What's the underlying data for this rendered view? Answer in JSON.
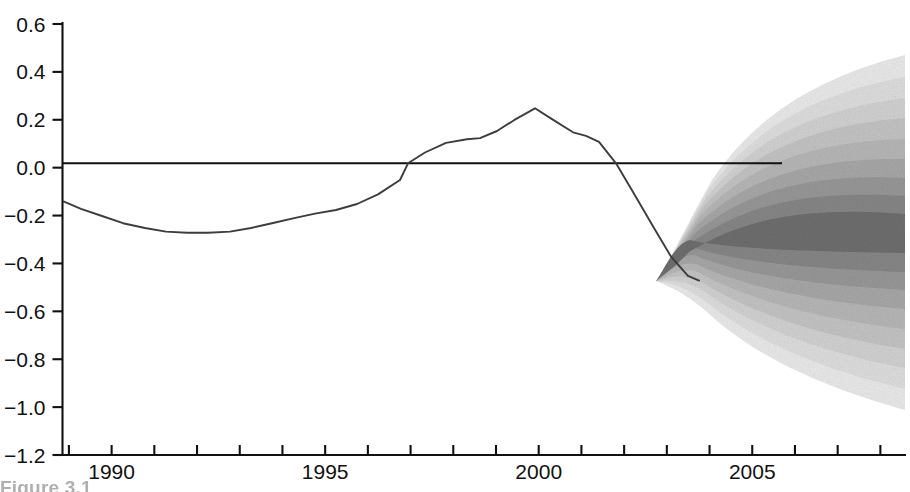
{
  "figure": {
    "caption_fragment": "Figure 3.1",
    "background_color": "#ffffff",
    "line_color": "#3a3a3a",
    "axis_color": "#111111",
    "fan_color": "#4a4a4a"
  },
  "axes": {
    "y": {
      "labels": [
        "0.6",
        "0.4",
        "0.2",
        "0.0",
        "−0.2",
        "−0.4",
        "−0.6",
        "−0.8",
        "−1.0",
        "−1.2"
      ],
      "values": [
        0.6,
        0.4,
        0.2,
        0.0,
        -0.2,
        -0.4,
        -0.6,
        -0.8,
        -1.0,
        -1.2
      ],
      "min": -1.2,
      "max": 0.6,
      "tick_step": 0.2
    },
    "x": {
      "labels": [
        "1990",
        "1995",
        "2000",
        "2005"
      ],
      "label_values": [
        1990,
        1995,
        2000,
        2005
      ],
      "ticks": [
        1989,
        1990,
        1991,
        1992,
        1993,
        1994,
        1995,
        1996,
        1997,
        1998,
        1999,
        2000,
        2001,
        2002,
        2003,
        2004,
        2005,
        2006,
        2007,
        2008
      ],
      "min": 1988.85,
      "max": 2008.6,
      "tick_step": 1
    }
  },
  "chart_data": {
    "type": "area",
    "title": "",
    "xlabel": "",
    "ylabel": "",
    "xlim": [
      1988.85,
      2008.6
    ],
    "ylim": [
      -1.2,
      0.6
    ],
    "grid": false,
    "legend": "none",
    "zero_line": {
      "value": 0.0,
      "x_start": 1988.85,
      "x_end": 2005.6
    },
    "series": [
      {
        "name": "History",
        "type": "line",
        "x": [
          1988.9,
          1989.3,
          1989.8,
          1990.3,
          1990.8,
          1991.3,
          1991.8,
          1992.3,
          1992.8,
          1993.3,
          1993.8,
          1994.3,
          1994.8,
          1995.3,
          1995.8,
          1996.3,
          1996.8,
          1997.0,
          1997.4,
          1997.9,
          1998.4,
          1998.7,
          1999.1,
          1999.5,
          2000.0,
          2000.4,
          2000.9,
          2001.2,
          2001.5,
          2001.9,
          2002.3,
          2002.8,
          2003.2,
          2003.6,
          2003.85
        ],
        "y": [
          -0.16,
          -0.19,
          -0.22,
          -0.25,
          -0.27,
          -0.285,
          -0.29,
          -0.29,
          -0.285,
          -0.27,
          -0.25,
          -0.23,
          -0.21,
          -0.195,
          -0.17,
          -0.13,
          -0.07,
          0.0,
          0.045,
          0.085,
          0.1,
          0.105,
          0.135,
          0.18,
          0.23,
          0.185,
          0.13,
          0.115,
          0.09,
          0.0,
          -0.12,
          -0.27,
          -0.39,
          -0.47,
          -0.49
        ]
      },
      {
        "name": "Projection central",
        "type": "line",
        "x": [
          2003.85,
          2004.2,
          2004.7,
          2005.2,
          2005.8,
          2006.4,
          2007.0,
          2007.6,
          2008.2,
          2008.6
        ],
        "y": [
          -0.49,
          -0.45,
          -0.38,
          -0.33,
          -0.3,
          -0.29,
          -0.285,
          -0.285,
          -0.285,
          -0.285
        ]
      }
    ],
    "fan_bands": [
      {
        "name": "90% interval",
        "shade": "#e8e8e8",
        "half_width_end": 0.73
      },
      {
        "name": "80% interval",
        "shade": "#dcdcdc",
        "half_width_end": 0.64
      },
      {
        "name": "70% interval",
        "shade": "#d0d0d0",
        "half_width_end": 0.555
      },
      {
        "name": "60% interval",
        "shade": "#c2c2c2",
        "half_width_end": 0.47
      },
      {
        "name": "50% interval",
        "shade": "#b4b4b4",
        "half_width_end": 0.385
      },
      {
        "name": "40% interval",
        "shade": "#a5a5a5",
        "half_width_end": 0.3
      },
      {
        "name": "30% interval",
        "shade": "#959595",
        "half_width_end": 0.222
      },
      {
        "name": "20% interval",
        "shade": "#848484",
        "half_width_end": 0.148
      },
      {
        "name": "10% interval",
        "shade": "#6f6f6f",
        "half_width_end": 0.075
      }
    ],
    "fan_start_x": 2003.85,
    "fan_start_y": -0.49,
    "fan_end_x": 2008.6,
    "fan_end_top": 0.41,
    "fan_end_bottom": -1.04
  }
}
